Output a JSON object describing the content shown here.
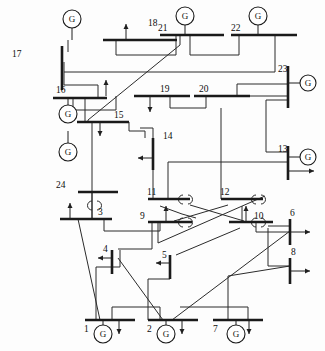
{
  "figure": {
    "type": "single-line-diagram",
    "width": 325,
    "height": 351,
    "background": "#ffffff",
    "line_color": "#2b2b2b",
    "bus_color": "#1a1a1a",
    "generator_symbol": "G"
  },
  "buses": [
    {
      "id": "bus-17",
      "label": "17",
      "orientation": "vertical",
      "x": 62,
      "y": 46,
      "len": 44,
      "label_x": 12,
      "label_y": 57,
      "label_anchor": "start"
    },
    {
      "id": "bus-18",
      "label": "18",
      "orientation": "horizontal",
      "x": 103,
      "y": 40,
      "len": 74,
      "label_x": 148,
      "label_y": 26,
      "label_anchor": "start"
    },
    {
      "id": "bus-21",
      "label": "21",
      "orientation": "horizontal",
      "x": 160,
      "y": 35,
      "len": 64,
      "label_x": 158,
      "label_y": 31,
      "label_anchor": "start"
    },
    {
      "id": "bus-22",
      "label": "22",
      "orientation": "horizontal",
      "x": 231,
      "y": 35,
      "len": 66,
      "label_x": 231,
      "label_y": 31,
      "label_anchor": "start"
    },
    {
      "id": "bus-23",
      "label": "23",
      "orientation": "vertical",
      "x": 288,
      "y": 66,
      "len": 42,
      "label_x": 278,
      "label_y": 72,
      "label_anchor": "start"
    },
    {
      "id": "bus-16",
      "label": "16",
      "orientation": "horizontal",
      "x": 53,
      "y": 98,
      "len": 54,
      "label_x": 56,
      "label_y": 93,
      "label_anchor": "start"
    },
    {
      "id": "bus-19",
      "label": "19",
      "orientation": "horizontal",
      "x": 134,
      "y": 96,
      "len": 56,
      "label_x": 160,
      "label_y": 92,
      "label_anchor": "start"
    },
    {
      "id": "bus-20",
      "label": "20",
      "orientation": "horizontal",
      "x": 194,
      "y": 96,
      "len": 56,
      "label_x": 199,
      "label_y": 92,
      "label_anchor": "start"
    },
    {
      "id": "bus-15",
      "label": "15",
      "orientation": "horizontal",
      "x": 77,
      "y": 122,
      "len": 52,
      "label_x": 114,
      "label_y": 118,
      "label_anchor": "start"
    },
    {
      "id": "bus-14",
      "label": "14",
      "orientation": "vertical",
      "x": 153,
      "y": 138,
      "len": 32,
      "label_x": 163,
      "label_y": 139,
      "label_anchor": "start"
    },
    {
      "id": "bus-13",
      "label": "13",
      "orientation": "vertical",
      "x": 288,
      "y": 146,
      "len": 34,
      "label_x": 278,
      "label_y": 152,
      "label_anchor": "start"
    },
    {
      "id": "bus-24",
      "label": "24",
      "orientation": "horizontal",
      "x": 78,
      "y": 192,
      "len": 40,
      "label_x": 56,
      "label_y": 188,
      "label_anchor": "start"
    },
    {
      "id": "bus-11",
      "label": "11",
      "orientation": "horizontal",
      "x": 148,
      "y": 199,
      "len": 42,
      "label_x": 147,
      "label_y": 195,
      "label_anchor": "start"
    },
    {
      "id": "bus-12",
      "label": "12",
      "orientation": "horizontal",
      "x": 221,
      "y": 199,
      "len": 42,
      "label_x": 220,
      "label_y": 195,
      "label_anchor": "start"
    },
    {
      "id": "bus-3",
      "label": "3",
      "orientation": "horizontal",
      "x": 60,
      "y": 219,
      "len": 52,
      "label_x": 98,
      "label_y": 215,
      "label_anchor": "start"
    },
    {
      "id": "bus-9",
      "label": "9",
      "orientation": "horizontal",
      "x": 148,
      "y": 222,
      "len": 44,
      "label_x": 140,
      "label_y": 219,
      "label_anchor": "start"
    },
    {
      "id": "bus-10",
      "label": "10",
      "orientation": "horizontal",
      "x": 229,
      "y": 222,
      "len": 44,
      "label_x": 254,
      "label_y": 219,
      "label_anchor": "start"
    },
    {
      "id": "bus-6",
      "label": "6",
      "orientation": "vertical",
      "x": 290,
      "y": 219,
      "len": 26,
      "label_x": 290,
      "label_y": 216,
      "label_anchor": "start"
    },
    {
      "id": "bus-8",
      "label": "8",
      "orientation": "vertical",
      "x": 290,
      "y": 258,
      "len": 26,
      "label_x": 291,
      "label_y": 255,
      "label_anchor": "start"
    },
    {
      "id": "bus-4",
      "label": "4",
      "orientation": "vertical",
      "x": 112,
      "y": 250,
      "len": 24,
      "label_x": 103,
      "label_y": 252,
      "label_anchor": "start"
    },
    {
      "id": "bus-5",
      "label": "5",
      "orientation": "vertical",
      "x": 170,
      "y": 255,
      "len": 24,
      "label_x": 162,
      "label_y": 258,
      "label_anchor": "start"
    },
    {
      "id": "bus-1",
      "label": "1",
      "orientation": "horizontal",
      "x": 85,
      "y": 320,
      "len": 50,
      "label_x": 84,
      "label_y": 332,
      "label_anchor": "start"
    },
    {
      "id": "bus-2",
      "label": "2",
      "orientation": "horizontal",
      "x": 148,
      "y": 320,
      "len": 50,
      "label_x": 147,
      "label_y": 332,
      "label_anchor": "start"
    },
    {
      "id": "bus-7",
      "label": "7",
      "orientation": "horizontal",
      "x": 213,
      "y": 320,
      "len": 50,
      "label_x": 213,
      "label_y": 332,
      "label_anchor": "start"
    }
  ],
  "generators": [
    {
      "id": "gen-18",
      "bus": "18",
      "cx": 72,
      "cy": 19,
      "r": 9,
      "stem": [
        72,
        28,
        72,
        40
      ]
    },
    {
      "id": "gen-21",
      "bus": "21",
      "cx": 185,
      "cy": 16,
      "r": 9,
      "stem": [
        185,
        25,
        185,
        35
      ]
    },
    {
      "id": "gen-22",
      "bus": "22",
      "cx": 258,
      "cy": 16,
      "r": 9,
      "stem": [
        258,
        25,
        258,
        35
      ]
    },
    {
      "id": "gen-23a",
      "bus": "23",
      "cx": 308,
      "cy": 83,
      "r": 8,
      "stem": [
        288,
        83,
        300,
        83
      ]
    },
    {
      "id": "gen-13",
      "bus": "13",
      "cx": 308,
      "cy": 157,
      "r": 8,
      "stem": [
        288,
        157,
        300,
        157
      ]
    },
    {
      "id": "gen-16",
      "bus": "16",
      "cx": 68,
      "cy": 114,
      "r": 9,
      "stem": [
        68,
        98,
        68,
        105
      ]
    },
    {
      "id": "gen-15",
      "bus": "15",
      "cx": 68,
      "cy": 152,
      "r": 9,
      "stem": [
        68,
        131,
        68,
        143
      ]
    },
    {
      "id": "gen-1",
      "bus": "1",
      "cx": 103,
      "cy": 334,
      "r": 9,
      "stem": [
        103,
        320,
        103,
        325
      ]
    },
    {
      "id": "gen-2",
      "bus": "2",
      "cx": 166,
      "cy": 334,
      "r": 9,
      "stem": [
        166,
        320,
        166,
        325
      ]
    },
    {
      "id": "gen-7",
      "bus": "7",
      "cx": 236,
      "cy": 334,
      "r": 9,
      "stem": [
        236,
        320,
        236,
        325
      ]
    }
  ],
  "loads": [
    {
      "id": "load-18",
      "x": 126,
      "y": 40,
      "dir": "up",
      "len": 16
    },
    {
      "id": "load-19a",
      "x": 106,
      "y": 96,
      "dir": "up",
      "len": 16
    },
    {
      "id": "load-19b",
      "x": 150,
      "y": 96,
      "dir": "down",
      "len": 16
    },
    {
      "id": "load-15",
      "x": 100,
      "y": 122,
      "dir": "down",
      "len": 14
    },
    {
      "id": "load-14",
      "x": 153,
      "y": 158,
      "dir": "left",
      "len": 15
    },
    {
      "id": "load-13",
      "x": 288,
      "y": 171,
      "dir": "right",
      "len": 26
    },
    {
      "id": "load-3",
      "x": 70,
      "y": 219,
      "dir": "up",
      "len": 16
    },
    {
      "id": "load-9",
      "x": 166,
      "y": 222,
      "dir": "up",
      "len": 16
    },
    {
      "id": "load-10",
      "x": 246,
      "y": 222,
      "dir": "up",
      "len": 16
    },
    {
      "id": "load-6",
      "x": 290,
      "y": 232,
      "dir": "right",
      "len": 20
    },
    {
      "id": "load-8",
      "x": 290,
      "y": 271,
      "dir": "right",
      "len": 20
    },
    {
      "id": "load-4",
      "x": 112,
      "y": 258,
      "dir": "left",
      "len": 14
    },
    {
      "id": "load-5",
      "x": 170,
      "y": 263,
      "dir": "left",
      "len": 14
    },
    {
      "id": "load-1",
      "x": 119,
      "y": 320,
      "dir": "down",
      "len": 14
    },
    {
      "id": "load-2",
      "x": 182,
      "y": 320,
      "dir": "down",
      "len": 14
    },
    {
      "id": "load-7",
      "x": 249,
      "y": 320,
      "dir": "down",
      "len": 14
    }
  ],
  "branches": [
    {
      "id": "line-17-18",
      "points": "68,52 68,40"
    },
    {
      "id": "line-18-21",
      "points": "116,40 116,55 176,55 176,35"
    },
    {
      "id": "line-21-22",
      "points": "190,35 190,55 239,55 239,35"
    },
    {
      "id": "line-22-17",
      "points": "275,35 275,72 64,72"
    },
    {
      "id": "line-17-16",
      "points": "64,62 64,85 98,85 98,98"
    },
    {
      "id": "line-21-15",
      "points": "180,35 180,45 88,120 88,122"
    },
    {
      "id": "line-16-19",
      "points": "73,98 73,110 116,110 116,96"
    },
    {
      "id": "line-19-20",
      "points": "170,96 170,108 206,108 206,96"
    },
    {
      "id": "line-20-23",
      "points": "215,96 288,96"
    },
    {
      "id": "line-20-23b",
      "points": "237,96 237,84 288,84"
    },
    {
      "id": "line-23-13",
      "points": "288,100 266,100 266,152 288,152"
    },
    {
      "id": "line-16-15",
      "points": "85,98 85,122"
    },
    {
      "id": "line-15-24",
      "points": "92,122 92,192"
    },
    {
      "id": "line-24-3",
      "points": "92,192 92,219"
    },
    {
      "id": "line-15-14",
      "points": "129,122 129,131 145,131 145,138"
    },
    {
      "id": "line-14-11",
      "points": "153,170 153,199"
    },
    {
      "id": "line-14-16",
      "points": "153,138 153,128 140,128"
    },
    {
      "id": "line-13-11",
      "points": "288,162 230,162 168,162 168,199"
    },
    {
      "id": "line-20-12",
      "points": "221,108 221,199"
    },
    {
      "id": "line-11-9",
      "points": "160,206 182,214 196,218"
    },
    {
      "id": "line-11-10",
      "points": "190,205 244,221"
    },
    {
      "id": "line-12-9",
      "points": "228,205 174,221"
    },
    {
      "id": "line-12-10",
      "points": "242,206 242,222"
    },
    {
      "id": "line-3-9",
      "points": "104,219 104,231 160,231 160,222"
    },
    {
      "id": "line-3-1",
      "points": "78,219 100,320"
    },
    {
      "id": "line-3-24",
      "points": "92,192 92,219"
    },
    {
      "id": "line-9-4",
      "points": "152,222 152,249 118,249"
    },
    {
      "id": "line-9-12",
      "points": "158,222 158,243 265,196"
    },
    {
      "id": "line-4-1",
      "points": "120,250 120,267 96,267 96,320"
    },
    {
      "id": "line-5-10",
      "points": "176,255 240,228"
    },
    {
      "id": "line-5-2",
      "points": "170,268 170,279 148,279 148,320"
    },
    {
      "id": "line-4-2",
      "points": "118,258 163,320"
    },
    {
      "id": "line-1-2",
      "points": "112,320 112,307 160,307 160,320"
    },
    {
      "id": "line-2-6",
      "points": "172,320 290,231"
    },
    {
      "id": "line-7-8",
      "points": "228,320 228,276 290,266"
    },
    {
      "id": "line-10-6",
      "points": "256,222 256,232 290,232"
    },
    {
      "id": "line-10-8",
      "points": "268,228 268,266 290,266"
    },
    {
      "id": "line-6-10",
      "points": "290,226 268,226"
    },
    {
      "id": "line-2-7",
      "points": "180,307 248,307 248,320"
    }
  ],
  "transformers": [
    {
      "id": "xfmr-11",
      "bus": "11",
      "x": 183,
      "y": 199
    },
    {
      "id": "xfmr-12",
      "bus": "12",
      "x": 256,
      "y": 199
    },
    {
      "id": "xfmr-9",
      "bus": "9",
      "x": 183,
      "y": 222
    },
    {
      "id": "xfmr-10",
      "bus": "10",
      "x": 256,
      "y": 222
    },
    {
      "id": "xfmr-3",
      "bus": "24",
      "x": 92,
      "y": 205
    }
  ],
  "counts": {
    "buses": 24,
    "generators": 10,
    "loads": 16
  }
}
